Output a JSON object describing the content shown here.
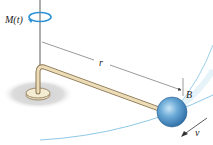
{
  "diagram": {
    "labels": {
      "moment": "M(t)",
      "radius": "r",
      "ball": "B",
      "velocity": "v"
    },
    "colors": {
      "rod_fill": "#e9dcc0",
      "rod_outline": "#a08a60",
      "ball": "#4a90c8",
      "ball_highlight": "#b9dcf2",
      "path": "#8fc8e6",
      "rotation_arrow": "#2f93d6",
      "shadow": "#d9d9d9",
      "dim_line": "#555555"
    }
  }
}
